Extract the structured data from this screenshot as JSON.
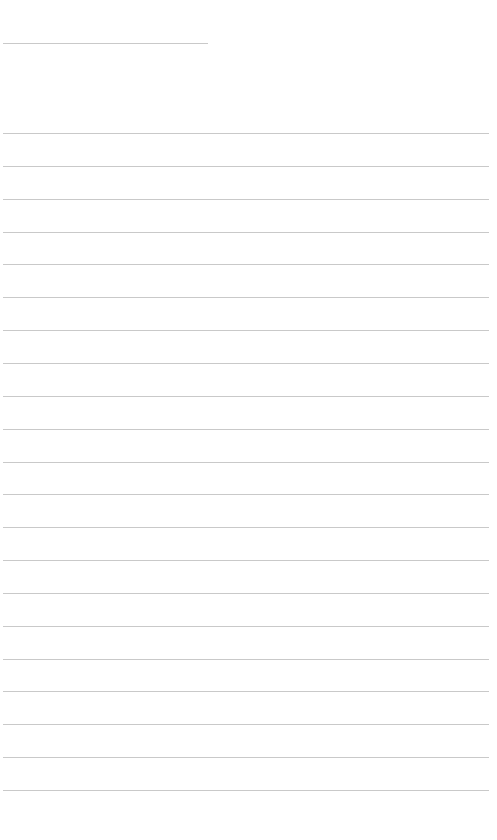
{
  "page": {
    "type": "blank lined paper",
    "background_color": "#ffffff",
    "line_color": "#c9c9c9",
    "header_line": {
      "x": 3,
      "y": 43,
      "width": 205
    },
    "ruled_lines": {
      "count": 21,
      "x": 3,
      "width": 486,
      "first_y": 133,
      "spacing": 32.85
    }
  }
}
